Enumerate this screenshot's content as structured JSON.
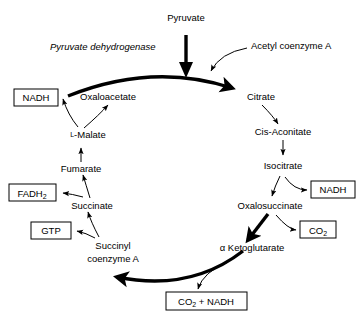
{
  "diagram": {
    "colors": {
      "background": "#ffffff",
      "stroke": "#000000",
      "text": "#000000"
    },
    "entry": {
      "substrate_label": "Pyruvate",
      "enzyme_label": "Pyruvate dehydrogenase",
      "cofactor_label": "Acetyl coenzyme A"
    },
    "metabolites": [
      {
        "id": "oxaloacetate",
        "label": "Oxaloacetate"
      },
      {
        "id": "citrate",
        "label": "Citrate"
      },
      {
        "id": "cis-aconitate",
        "label": "Cis-Aconitate",
        "italic_prefix": "Cis",
        "rest": "-Aconitate"
      },
      {
        "id": "isocitrate",
        "label": "Isocitrate"
      },
      {
        "id": "oxalosuccinate",
        "label": "Oxalosuccinate"
      },
      {
        "id": "a-ketoglutarate",
        "label": "α Ketoglutarate"
      },
      {
        "id": "succinyl-coa",
        "label_line1": "Succinyl",
        "label_line2": "coenzyme A"
      },
      {
        "id": "succinate",
        "label": "Succinate"
      },
      {
        "id": "fumarate",
        "label": "Fumarate"
      },
      {
        "id": "l-malate",
        "label": "L-Malate",
        "smallcap_prefix": "L",
        "rest": "-Malate"
      }
    ],
    "products": [
      {
        "id": "nadh-malate",
        "label": "NADH"
      },
      {
        "id": "fadh2",
        "label": "FADH",
        "subscript": "2"
      },
      {
        "id": "gtp",
        "label": "GTP"
      },
      {
        "id": "nadh-isocitrate",
        "label": "NADH"
      },
      {
        "id": "co2",
        "label": "CO",
        "subscript": "2"
      },
      {
        "id": "co2-nadh",
        "label_pre": "CO",
        "subscript": "2",
        "label_post": " + NADH"
      }
    ]
  }
}
